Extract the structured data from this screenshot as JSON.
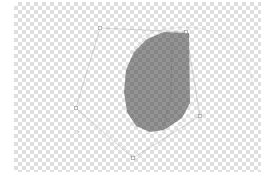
{
  "app": {
    "name": "Image Editor Canvas",
    "canvas_label": "transparent-canvas"
  },
  "canvas": {
    "width": 247,
    "height": 170,
    "offset_x": 14,
    "offset_y": 2,
    "background": "transparency-checkerboard",
    "checker_size_px": 4,
    "checker_light": "#ffffff",
    "checker_dark": "#cfcfcf"
  },
  "shapes": {
    "pentagon": {
      "name": "pentagon-path",
      "stroke": "#9a9a9a",
      "stroke_width": 0.7,
      "fill": "none",
      "opacity": 0.55,
      "points": "100,28 186,32 200,116 133,158 76,108"
    },
    "blob": {
      "name": "dark-blob-shape",
      "fill": "#3d3d3d",
      "opacity": 0.55,
      "path": "M 189,33 L 190,103 L 182,118 L 164,130 L 150,132 L 136,126 L 127,112 L 124,92 L 126,70 L 134,52 L 147,39 L 164,32 Z"
    },
    "arc": {
      "name": "faint-circle-arc",
      "stroke": "#bdbdbd",
      "stroke_width": 0.6,
      "opacity": 0.5,
      "path": "M 133,42 C 160,24 200,22 226,38 C 244,49 252,66 252,84"
    },
    "crease": {
      "name": "blob-crease-line",
      "stroke": "#6e6e6e",
      "stroke_width": 0.7,
      "opacity": 0.5,
      "path": "M 172,45 L 171,95 L 163,129"
    }
  },
  "handles": [
    {
      "name": "vertex-handle-top-left",
      "x": 100,
      "y": 28,
      "size": 3.2
    },
    {
      "name": "vertex-handle-top-right",
      "x": 186,
      "y": 32,
      "size": 3.0
    },
    {
      "name": "vertex-handle-right",
      "x": 200,
      "y": 116,
      "size": 3.0
    },
    {
      "name": "vertex-handle-bottom",
      "x": 133,
      "y": 158,
      "size": 3.4
    },
    {
      "name": "vertex-handle-left",
      "x": 76,
      "y": 108,
      "size": 3.0
    }
  ],
  "handle_style": {
    "stroke": "#8a8a8a",
    "fill": "#ffffff",
    "stroke_width": 0.7
  },
  "speck": {
    "name": "stray-pixel-speck",
    "x": 78,
    "y": 131,
    "color": "#a8a8a8"
  },
  "watermark": {
    "text": "",
    "color": "#d2d2d2"
  }
}
